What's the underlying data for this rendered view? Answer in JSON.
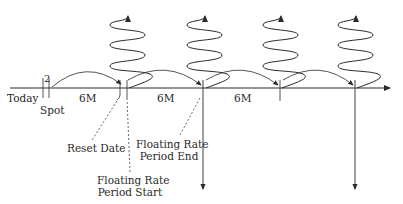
{
  "diagram": {
    "type": "interest-rate-swap-timeline",
    "axis": {
      "start_label": "Today",
      "spot_label": "Spot",
      "spot_lag": "2",
      "periods": [
        "6M",
        "6M",
        "6M"
      ]
    },
    "annotations": {
      "reset_date": "Reset Date",
      "period_start_line1": "Floating Rate",
      "period_start_line2": "Period Start",
      "period_end_line1": "Floating Rate",
      "period_end_line2": "Period End"
    },
    "colors": {
      "stroke": "#2a2a2a",
      "background": "#ffffff"
    }
  }
}
